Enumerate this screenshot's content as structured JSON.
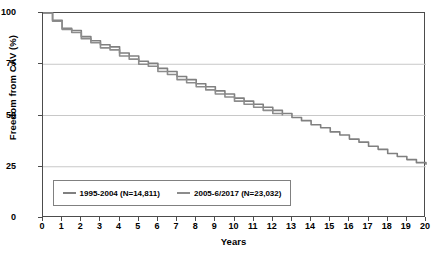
{
  "chart_data": {
    "type": "line",
    "title": "",
    "xlabel": "Years",
    "ylabel": "Freedom from CAV (%)",
    "xlim": [
      0,
      20
    ],
    "ylim": [
      0,
      100
    ],
    "grid": true,
    "legend_position": "bottom-left",
    "x_ticks": [
      "0",
      "1",
      "2",
      "3",
      "4",
      "5",
      "6",
      "7",
      "8",
      "9",
      "10",
      "11",
      "12",
      "13",
      "14",
      "15",
      "16",
      "17",
      "18",
      "19",
      "20"
    ],
    "y_ticks": [
      "0",
      "25",
      "50",
      "75",
      "100"
    ],
    "series": [
      {
        "name": "1995-2004 (N=14,811)",
        "color": "#808080",
        "x": [
          0,
          0.5,
          1,
          1.5,
          2,
          2.5,
          3,
          3.5,
          4,
          4.5,
          5,
          5.5,
          6,
          6.5,
          7,
          7.5,
          8,
          8.5,
          9,
          9.5,
          10,
          10.5,
          11,
          11.5,
          12,
          12.5,
          13,
          13.5,
          14,
          14.5,
          15,
          15.5,
          16,
          16.5,
          17,
          17.5,
          18,
          18.5,
          19,
          19.5,
          20
        ],
        "y": [
          100,
          96.5,
          92.5,
          91.5,
          88.5,
          86.5,
          84.5,
          83.5,
          80.5,
          79.0,
          76.5,
          75.5,
          73.0,
          71.5,
          69.0,
          67.5,
          65.5,
          64.0,
          62.0,
          60.5,
          58.5,
          57.0,
          55.5,
          54.0,
          52.5,
          51.0,
          49.0,
          47.5,
          45.5,
          44.0,
          42.0,
          40.5,
          38.5,
          37.0,
          35.0,
          33.5,
          31.5,
          30.0,
          28.5,
          27.0,
          26.0
        ]
      },
      {
        "name": "2005-6/2017 (N=23,032)",
        "color": "#8c8c8c",
        "x": [
          0,
          0.5,
          1,
          1.5,
          2,
          2.5,
          3,
          3.5,
          4,
          4.5,
          5,
          5.5,
          6,
          6.5,
          7,
          7.5,
          8,
          8.5,
          9,
          9.5,
          10,
          10.5,
          11,
          11.5,
          12,
          12.5
        ],
        "y": [
          100,
          96.0,
          92.0,
          90.5,
          87.5,
          85.5,
          83.0,
          82.0,
          79.0,
          77.5,
          75.0,
          74.0,
          71.5,
          70.0,
          67.5,
          66.0,
          64.0,
          62.5,
          60.5,
          59.0,
          57.0,
          55.5,
          54.0,
          52.5,
          51.0,
          50.0
        ]
      }
    ]
  },
  "legend": {
    "items": [
      {
        "label": "1995-2004 (N=14,811)"
      },
      {
        "label": "2005-6/2017 (N=23,032)"
      }
    ]
  },
  "colors": {
    "series_gray": "#808080",
    "frame": "#4c4c4c",
    "grid": "#c8c8c8"
  }
}
